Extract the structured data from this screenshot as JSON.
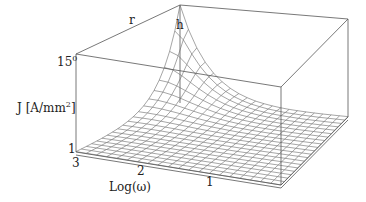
{
  "chart_data": {
    "type": "surface3d",
    "title": "",
    "zlabel": "J [A/mm²]",
    "xlabel": "Log(ω)",
    "ylabel_top": "r",
    "corner_label": "h",
    "z_ticks": [
      "1",
      "15"
    ],
    "z_top_superscript": "0",
    "x_ticks": [
      "3",
      "2",
      "1"
    ],
    "z_range": [
      1,
      15
    ],
    "x_range": [
      3,
      0
    ],
    "grid_resolution": [
      20,
      20
    ],
    "surface_description": "J rises steeply near the back corner (low Log(ω), near h) up to ~15 A/mm² and decays exponentially to ~1 A/mm² across the rest of the domain",
    "box": true,
    "grid": false,
    "colors": {
      "line": "#555555",
      "mesh": "#6a6a6a",
      "background": "#ffffff"
    }
  },
  "labels": {
    "r": "r",
    "h": "h",
    "z_max": "15",
    "z_max_sup": "0",
    "z_axis_main": "J [A/mm",
    "z_axis_sup": "2",
    "z_axis_end": "]",
    "z_min": "1",
    "x_tick_3": "3",
    "x_tick_2": "2",
    "x_tick_1": "1",
    "x_axis": "Log(ω)"
  }
}
